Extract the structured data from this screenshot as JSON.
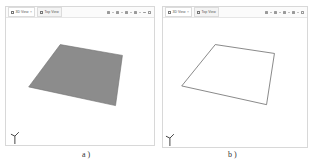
{
  "panels": [
    {
      "id": "a",
      "tabs": [
        {
          "label": "3D View",
          "closable": true,
          "active": true
        },
        {
          "label": "Top View",
          "closable": false,
          "active": false
        }
      ],
      "toolbar_icons": [
        "view-cube-icon",
        "dropdown-icon",
        "render-icon",
        "dropdown-icon",
        "navigate-icon",
        "dropdown-icon",
        "settings-icon",
        "dropdown-icon",
        "minimize-icon",
        "maximize-icon"
      ],
      "shape": {
        "type": "filled-plane",
        "fill": "#8c8c8c",
        "stroke": "#6e6e6e"
      },
      "caption": "a )"
    },
    {
      "id": "b",
      "tabs": [
        {
          "label": "3D View",
          "closable": true,
          "active": true
        },
        {
          "label": "Top View",
          "closable": false,
          "active": false
        }
      ],
      "toolbar_icons": [
        "view-cube-icon",
        "dropdown-icon",
        "render-icon",
        "dropdown-icon",
        "navigate-icon",
        "dropdown-icon",
        "settings-icon",
        "dropdown-icon",
        "maximize-icon"
      ],
      "shape": {
        "type": "outline-plane",
        "fill": "#ffffff",
        "stroke": "#555555"
      },
      "caption": "b )"
    }
  ],
  "colors": {
    "panel_border": "#d8d8d8",
    "plane_fill": "#8c8c8c",
    "plane_edge": "#555555",
    "axis": "#444444"
  }
}
